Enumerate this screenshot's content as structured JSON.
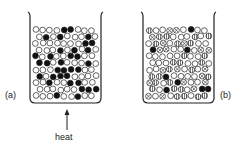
{
  "figure": {
    "panel_a": {
      "label": "(a)",
      "description": "Beaker containing a mixture of black and white particles, heated from below"
    },
    "panel_b": {
      "label": "(b)",
      "description": "Beaker containing particles of several kinds: white, black, striped and crossed"
    },
    "heat_label": "heat",
    "particle_types": [
      "black-filled",
      "white-hollow",
      "striped",
      "crossed"
    ],
    "colors": {
      "stroke": "#222222",
      "fill_black": "#111111",
      "fill_white": "#ffffff",
      "fill_striped": "#bbbbbb"
    }
  }
}
